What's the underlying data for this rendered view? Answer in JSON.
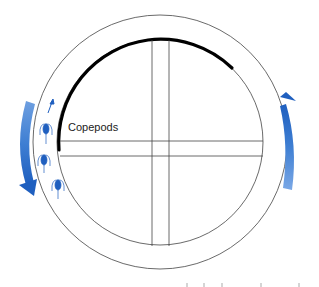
{
  "diagram": {
    "label": "Copepods",
    "colors": {
      "arrow": "#2f6fc4",
      "arrow_light": "#6e9fe0",
      "copepod": "#1f5fbf",
      "line": "#333333",
      "thick_arc": "#000000"
    },
    "copepod_count": 3,
    "icons": [
      "rotation-arrow-ccw-left",
      "rotation-arrow-up-right",
      "swim-direction-arrow",
      "copepod-icon"
    ]
  }
}
